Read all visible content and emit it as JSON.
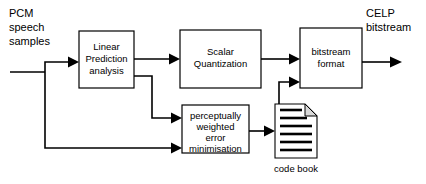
{
  "diagram": {
    "canvas": {
      "width": 426,
      "height": 184
    },
    "colors": {
      "background": "#ffffff",
      "stroke": "#000000",
      "box_fill": "#ffffff",
      "doc_fold_fill": "#d9d9d9"
    },
    "labels": {
      "input": {
        "line1": "PCM",
        "line2": "speech",
        "line3": "samples"
      },
      "output": {
        "line1": "CELP",
        "line2": "bitstream"
      },
      "codebook_caption": "code book"
    },
    "blocks": [
      {
        "id": "linear-prediction-analysis",
        "lines": [
          "Linear",
          "Prediction",
          "analysis"
        ],
        "x": 79,
        "y": 31,
        "w": 55,
        "h": 57
      },
      {
        "id": "scalar-quantization",
        "lines": [
          "Scalar",
          "Quantization"
        ],
        "x": 180,
        "y": 30,
        "w": 81,
        "h": 58
      },
      {
        "id": "bitstream-format",
        "lines": [
          "bitstream",
          "format"
        ],
        "x": 300,
        "y": 28,
        "w": 62,
        "h": 60
      },
      {
        "id": "perceptually-weighted-error-minimisation",
        "lines": [
          "perceptually",
          "weighted",
          "error",
          "minimisation"
        ],
        "x": 182,
        "y": 105,
        "w": 67,
        "h": 48
      }
    ],
    "codebook": {
      "id": "code-book-document",
      "x": 275,
      "y": 104,
      "w": 42,
      "h": 54,
      "fold": 12,
      "line_count": 6
    },
    "connections": [
      {
        "id": "input-bus",
        "from": "input edge",
        "to": "branch point"
      },
      {
        "id": "input-to-lp",
        "from": "branch point",
        "to": "linear-prediction-analysis"
      },
      {
        "id": "input-to-pwem",
        "from": "branch point",
        "to": "perceptually-weighted-error-minimisation"
      },
      {
        "id": "lp-to-scalar",
        "from": "linear-prediction-analysis",
        "to": "scalar-quantization"
      },
      {
        "id": "lp-to-pwem",
        "from": "linear-prediction-analysis",
        "to": "perceptually-weighted-error-minimisation"
      },
      {
        "id": "scalar-to-bitstream",
        "from": "scalar-quantization",
        "to": "bitstream-format"
      },
      {
        "id": "pwem-to-codebook",
        "from": "perceptually-weighted-error-minimisation",
        "to": "code-book-document"
      },
      {
        "id": "codebook-to-bitstream",
        "from": "code-book-document",
        "to": "bitstream-format"
      },
      {
        "id": "bitstream-out",
        "from": "bitstream-format",
        "to": "output edge"
      }
    ]
  }
}
